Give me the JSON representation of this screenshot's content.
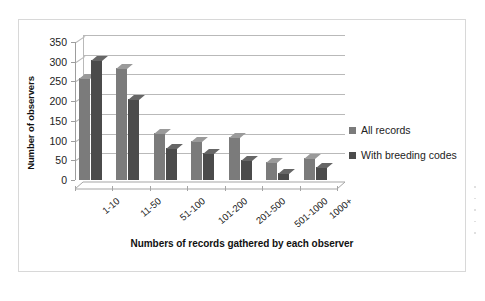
{
  "chart_data": {
    "type": "bar",
    "title": "",
    "xlabel": "Numbers of records gathered by each observer",
    "ylabel": "Number of observers",
    "categories": [
      "1-10",
      "11-50",
      "51-100",
      "101-200",
      "201-500",
      "501-1000",
      "1000+"
    ],
    "series": [
      {
        "name": "All records",
        "color": "#7b7b7b",
        "values": [
          260,
          283,
          118,
          100,
          108,
          45,
          55
        ]
      },
      {
        "name": "With breeding codes",
        "color": "#4b4b4b",
        "values": [
          305,
          205,
          80,
          68,
          50,
          18,
          33
        ]
      }
    ],
    "ylim": [
      0,
      350
    ],
    "yticks": [
      0,
      50,
      100,
      150,
      200,
      250,
      300,
      350
    ],
    "ytick_labels": [
      "0",
      "50",
      "100",
      "150",
      "200",
      "250",
      "300",
      "350"
    ],
    "grid": true,
    "legend_position": "right",
    "style": "3d-column"
  },
  "legend": {
    "entries": [
      {
        "label": "All records"
      },
      {
        "label": "With breeding codes"
      }
    ]
  }
}
